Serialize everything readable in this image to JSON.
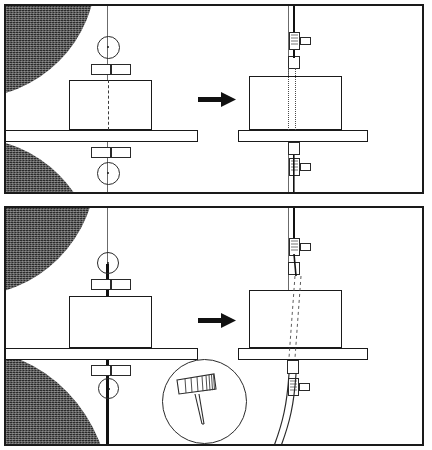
{
  "figure": {
    "kind": "engineering-process-diagram",
    "title": "",
    "panel_count": 2,
    "panels": [
      {
        "id": "top",
        "label": "",
        "condition": "rigid-straight-tool",
        "left_scene": {
          "name": "before-drilling",
          "tool_line": "thin",
          "tool_color": "#6b6b6b",
          "centerline": "dashed",
          "workpiece": "block-on-table",
          "guide_bushing_pairs": 2,
          "center_marks": 2
        },
        "right_scene": {
          "name": "after-drilling",
          "tool_line": "straight",
          "bore": "straight-parallel-dotted",
          "collars": 2,
          "clamps": 2
        },
        "arrow": "right-arrow",
        "corner_masses": [
          "top-left",
          "bottom-left"
        ],
        "detail_inset": false
      },
      {
        "id": "bottom",
        "label": "",
        "condition": "deflected-tool",
        "left_scene": {
          "name": "before-drilling",
          "tool_line": "thick",
          "tool_color": "#111111",
          "centerline": "solid-heavy",
          "workpiece": "block-on-table",
          "guide_bushing_pairs": 2,
          "center_marks": 2
        },
        "right_scene": {
          "name": "after-drilling",
          "tool_line": "curved-deflected",
          "bore": "skewed-dashed",
          "collars": 2,
          "clamps": 2
        },
        "arrow": "right-arrow",
        "corner_masses": [
          "top-left",
          "bottom-left"
        ],
        "detail_inset": true,
        "detail": {
          "name": "magnified-tool-tip",
          "shows": "hatched-flute-band-with-splayed-tip",
          "hatch_lines": 9
        }
      }
    ],
    "colors": {
      "ink": "#1a1a1a",
      "mass": "#2b2b2b",
      "thin_line": "#6b6b6b",
      "paper": "#ffffff"
    }
  }
}
